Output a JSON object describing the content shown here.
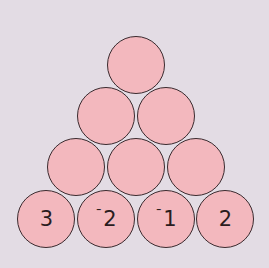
{
  "diagram": {
    "type": "number-pyramid",
    "rows": [
      {
        "cells": [
          {
            "value": "",
            "cx": 137,
            "cy": 66
          }
        ]
      },
      {
        "cells": [
          {
            "value": "",
            "cx": 107,
            "cy": 117
          },
          {
            "value": "",
            "cx": 167,
            "cy": 117
          }
        ]
      },
      {
        "cells": [
          {
            "value": "",
            "cx": 77,
            "cy": 168
          },
          {
            "value": "",
            "cx": 137,
            "cy": 168
          },
          {
            "value": "",
            "cx": 197,
            "cy": 168
          }
        ]
      },
      {
        "cells": [
          {
            "value": "3",
            "neg": "",
            "digit": "3",
            "cx": 47,
            "cy": 220
          },
          {
            "value": "-2",
            "neg": "¯",
            "digit": "2",
            "cx": 107,
            "cy": 220
          },
          {
            "value": "-1",
            "neg": "¯",
            "digit": "1",
            "cx": 167,
            "cy": 220
          },
          {
            "value": "2",
            "neg": "",
            "digit": "2",
            "cx": 226,
            "cy": 220
          }
        ]
      }
    ],
    "colors": {
      "background": "#e3dce4",
      "circle_fill": "#f3b8be",
      "circle_stroke": "#3a2a2e"
    }
  }
}
